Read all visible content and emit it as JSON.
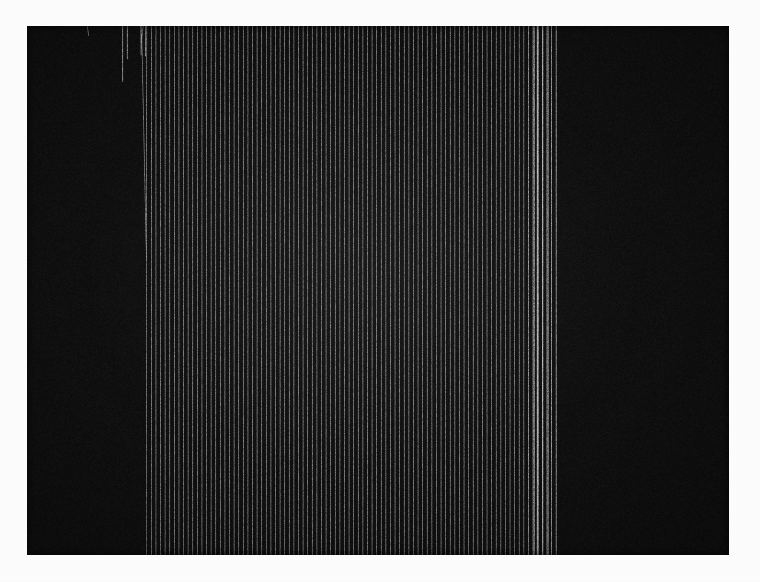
{
  "page": {
    "width": 760,
    "height": 582,
    "background_color": "#fdfdfd"
  },
  "plot": {
    "frame": {
      "x": 27,
      "y": 26,
      "width": 702,
      "height": 529
    },
    "background_color": "#101010",
    "line_color": "#e9e9e9",
    "line_color_dim": "#8d8d8d",
    "line_width": 0.85,
    "render": "wireframe-mesh",
    "projection": "oblique-parallel",
    "hidden_line_removal": true
  },
  "chart_data": {
    "type": "surface",
    "title": "3D wireframe mesh surface",
    "subtitle": "",
    "xlabel": "",
    "ylabel": "",
    "zlabel": "",
    "grid": false,
    "legend": false,
    "axes_visible": false,
    "tick_labels": [],
    "annotations": [],
    "rows": 90,
    "cols": 96,
    "xlim": [
      0,
      1
    ],
    "ylim": [
      0,
      1
    ],
    "zlim": [
      0,
      1
    ],
    "view": {
      "origin_x": 0.085,
      "origin_y": 0.155,
      "col_step_x": 0.00655,
      "col_step_y": 0.00118,
      "row_step_x": 0.00285,
      "row_step_y": 0.00855,
      "z_scale": 0.25
    },
    "seed": 20240517,
    "surface_model": {
      "description": "Noisy decaying ridge field with a smooth terraced plateau-and-trough feature in the mid-left foreground, a tall narrow spike at the back-left corner, rough stochastic texture over the far field, and a steeply falling right-hand flank.",
      "base_level": 0.34,
      "noise_amplitude": 0.085,
      "noise_amplitude_back": 0.15,
      "ridge_amplitude": 0.055,
      "spike": {
        "row": 0.04,
        "col": 0.07,
        "height": 0.88,
        "sharpness": 34
      },
      "plateau": {
        "row0": 0.3,
        "row1": 0.66,
        "col0": 0.1,
        "col1": 0.46,
        "level": 0.16,
        "edge_softness": 0.055
      },
      "trough": {
        "row": 0.5,
        "col": 0.28,
        "depth": 0.1,
        "radius": 0.22
      },
      "right_flank": {
        "col_start": 0.8,
        "falloff": 0.62
      },
      "front_fringe_amplitude": 0.11,
      "back_roughness": 0.22
    },
    "features": [
      {
        "name": "back-left-spike",
        "x_px": 98,
        "y_px": 43,
        "label": "tall narrow peak"
      },
      {
        "name": "terraced-plateau",
        "x_px": 300,
        "y_px": 280,
        "label": "smooth flat terrace"
      },
      {
        "name": "right-flank-dropoff",
        "x_px": 690,
        "y_px": 170,
        "label": "steep right edge"
      },
      {
        "name": "front-fringe",
        "x_px": 470,
        "y_px": 500,
        "label": "ragged foreground edge"
      }
    ]
  },
  "accessibility": {
    "alt_text": "A dense white wireframe mesh surface rendered in three dimensions on a black background, resembling a waterfall or spectrogram plot, with a sharp spike at the upper left, a smooth terraced plateau in the centre-left, and a rough noisy field falling away to the right."
  }
}
